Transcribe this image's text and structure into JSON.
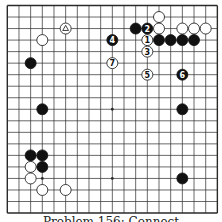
{
  "diagram": {
    "type": "go-board",
    "size": 19,
    "colors": {
      "line": "#2a2a2a",
      "black": "#111111",
      "white": "#ffffff",
      "background": "#ffffff"
    },
    "star_points": [
      [
        3,
        3
      ],
      [
        9,
        3
      ],
      [
        15,
        3
      ],
      [
        3,
        9
      ],
      [
        9,
        9
      ],
      [
        15,
        9
      ],
      [
        3,
        15
      ],
      [
        9,
        15
      ],
      [
        15,
        15
      ]
    ],
    "stones": [
      {
        "color": "white",
        "col": 5,
        "row": 2,
        "mark": "triangle"
      },
      {
        "color": "white",
        "col": 3,
        "row": 3
      },
      {
        "color": "black",
        "col": 2,
        "row": 5
      },
      {
        "color": "black",
        "col": 3,
        "row": 9
      },
      {
        "color": "white",
        "col": 13,
        "row": 1
      },
      {
        "color": "black",
        "col": 11,
        "row": 2
      },
      {
        "color": "black",
        "col": 12,
        "row": 2,
        "label": "2"
      },
      {
        "color": "white",
        "col": 13,
        "row": 2
      },
      {
        "color": "white",
        "col": 15,
        "row": 2
      },
      {
        "color": "white",
        "col": 16,
        "row": 2
      },
      {
        "color": "white",
        "col": 17,
        "row": 2
      },
      {
        "color": "white",
        "col": 12,
        "row": 3,
        "label": "1"
      },
      {
        "color": "black",
        "col": 13,
        "row": 3
      },
      {
        "color": "black",
        "col": 14,
        "row": 3
      },
      {
        "color": "black",
        "col": 15,
        "row": 3
      },
      {
        "color": "black",
        "col": 16,
        "row": 3
      },
      {
        "color": "black",
        "col": 9,
        "row": 3,
        "label": "4"
      },
      {
        "color": "white",
        "col": 12,
        "row": 4,
        "label": "3"
      },
      {
        "color": "white",
        "col": 9,
        "row": 5,
        "label": "7"
      },
      {
        "color": "white",
        "col": 12,
        "row": 6,
        "label": "5"
      },
      {
        "color": "black",
        "col": 15,
        "row": 6,
        "label": "6"
      },
      {
        "color": "black",
        "col": 15,
        "row": 9
      },
      {
        "color": "black",
        "col": 2,
        "row": 13
      },
      {
        "color": "black",
        "col": 3,
        "row": 13
      },
      {
        "color": "white",
        "col": 2,
        "row": 14
      },
      {
        "color": "black",
        "col": 3,
        "row": 14
      },
      {
        "color": "white",
        "col": 2,
        "row": 15
      },
      {
        "color": "white",
        "col": 3,
        "row": 16
      },
      {
        "color": "white",
        "col": 5,
        "row": 16
      },
      {
        "color": "black",
        "col": 15,
        "row": 15
      }
    ]
  },
  "caption": "Problem 156: Connect"
}
